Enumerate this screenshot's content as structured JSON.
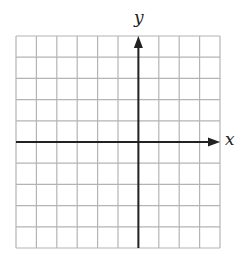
{
  "chart_data": {
    "type": "grid",
    "title": "",
    "xlabel": "x",
    "ylabel": "y",
    "grid": true,
    "columns": 10,
    "rows": 10,
    "y_axis_column": 6,
    "x_axis_row": 5,
    "xlim": [
      -6,
      4
    ],
    "ylim": [
      -5,
      5
    ],
    "tick_labels": false
  },
  "labels": {
    "x_axis": "x",
    "y_axis": "y"
  },
  "colors": {
    "grid": "#b4b4b4",
    "axis": "#222222",
    "background": "#ffffff"
  }
}
